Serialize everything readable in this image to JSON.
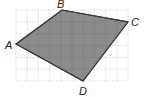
{
  "figure": {
    "type": "quadrilateral-on-grid",
    "grid": {
      "x0": 16,
      "y0": 10,
      "cols": 10,
      "rows": 6,
      "cell_w": 11.2,
      "cell_h": 11.83,
      "line_color": "#bdbdbd"
    },
    "fill_color": "#8c8c8c",
    "stroke_color": "#3a3a3a",
    "vertices": [
      {
        "name": "A",
        "x": 16,
        "y": 44,
        "label_x": 5,
        "label_y": 49
      },
      {
        "name": "B",
        "x": 62,
        "y": 10,
        "label_x": 57,
        "label_y": 8
      },
      {
        "name": "C",
        "x": 128,
        "y": 22,
        "label_x": 131,
        "label_y": 26
      },
      {
        "name": "D",
        "x": 83,
        "y": 81,
        "label_x": 79,
        "label_y": 95
      }
    ]
  },
  "labels": {
    "A": "A",
    "B": "B",
    "C": "C",
    "D": "D"
  }
}
